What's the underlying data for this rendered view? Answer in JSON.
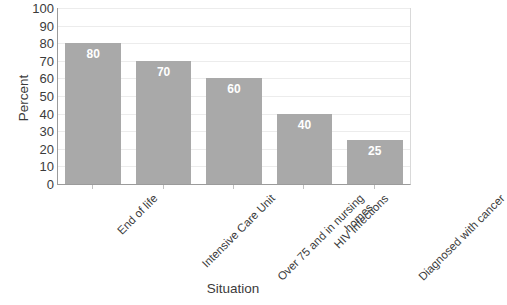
{
  "chart_data": {
    "type": "bar",
    "title": "",
    "subtitle": "",
    "xlabel": "Situation",
    "ylabel": "Percent",
    "categories": [
      "End of life",
      "Intensive Care Unit",
      "Over 75 and in nursing\nhomes",
      "HIV infections",
      "Diagnosed with cancer"
    ],
    "values": [
      80,
      70,
      60,
      40,
      25
    ],
    "data_labels": [
      "80",
      "70",
      "60",
      "40",
      "25"
    ],
    "ylim": [
      0,
      100
    ],
    "ytick_step": 10,
    "yticks": [
      100,
      90,
      80,
      70,
      60,
      50,
      40,
      30,
      20,
      10,
      0
    ],
    "ytick_labels": [
      "100",
      "90",
      "80",
      "70",
      "60",
      "50",
      "40",
      "30",
      "20",
      "10",
      "0"
    ],
    "grid": true,
    "grid_axis": "y",
    "legend": false,
    "legend_position": "none",
    "bar_color": "#a9a9a9",
    "data_label_color": "#ffffff",
    "gridline_color": "#ececec",
    "axis_line_color": "#9b9b9b",
    "text_color": "#3b3b3b",
    "background_color": "#ffffff",
    "xtick_label_rotation": -45,
    "series": [
      {
        "name": "Percent",
        "values": [
          80,
          70,
          60,
          40,
          25
        ]
      }
    ]
  }
}
